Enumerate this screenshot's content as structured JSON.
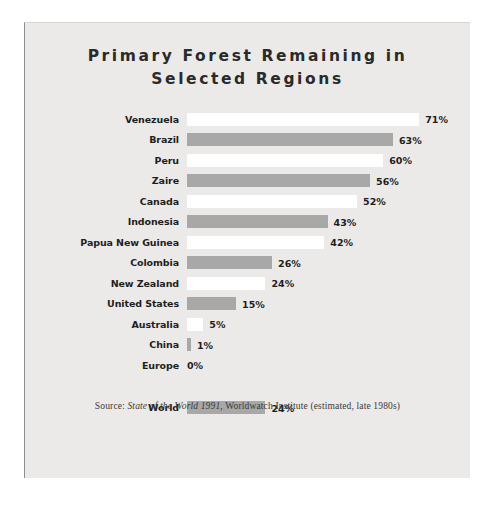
{
  "chart_data": {
    "type": "bar",
    "orientation": "horizontal",
    "title": "Primary Forest Remaining in Selected Regions",
    "title_line1": "Primary Forest Remaining in",
    "title_line2": "Selected Regions",
    "xlabel": "",
    "ylabel": "",
    "xlim": [
      0,
      71
    ],
    "grid": false,
    "legend": "none",
    "value_suffix": "%",
    "categories": [
      "Venezuela",
      "Brazil",
      "Peru",
      "Zaire",
      "Canada",
      "Indonesia",
      "Papua New Guinea",
      "Colombia",
      "New Zealand",
      "United States",
      "Australia",
      "China",
      "Europe"
    ],
    "values": [
      71,
      63,
      60,
      56,
      52,
      43,
      42,
      26,
      24,
      15,
      5,
      1,
      0
    ],
    "value_labels": [
      "71%",
      "63%",
      "60%",
      "56%",
      "52%",
      "43%",
      "42%",
      "26%",
      "24%",
      "15%",
      "5%",
      "1%",
      "0%"
    ],
    "bar_colors": [
      "white",
      "gray",
      "white",
      "gray",
      "white",
      "gray",
      "white",
      "gray",
      "white",
      "gray",
      "white",
      "gray",
      "none"
    ],
    "summary_row": {
      "category": "World",
      "value": 24,
      "value_label": "24%",
      "bar_color": "gray"
    },
    "source": {
      "prefix": "Source: ",
      "publication": "State of the World 1991",
      "suffix": ", Worldwatch Institute (estimated, late 1980s)"
    },
    "colors": {
      "bar_gray": "#a8a8a8",
      "bar_white": "#ffffff",
      "card_background": "#eceae8",
      "text": "#1e1e1e",
      "page_background": "#ffffff"
    }
  }
}
